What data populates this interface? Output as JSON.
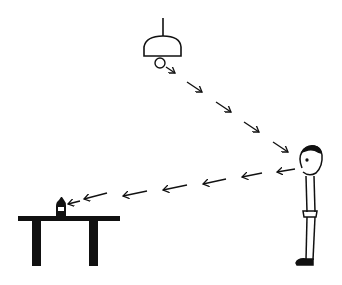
{
  "figure": {
    "type": "line-drawing illustration",
    "elements": [
      "ceiling-lamp",
      "light-ray-arrows-lamp-to-eye",
      "person",
      "sight-arrows-eye-to-bottle",
      "bottle",
      "table"
    ],
    "colors": {
      "ink": "#111111",
      "background": "#ffffff"
    }
  }
}
